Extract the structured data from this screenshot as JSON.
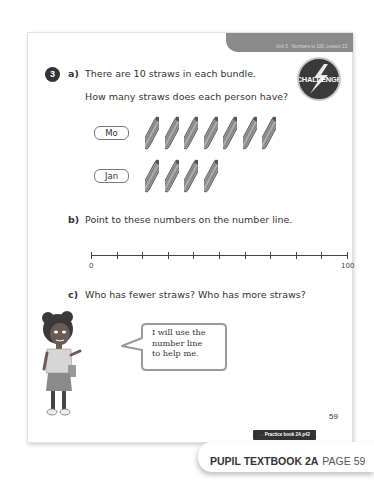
{
  "header": {
    "unit_label": "Unit 3 · Numbers to 100, Lesson 13",
    "badge_label": "CHALLENGE"
  },
  "question": {
    "number": "3",
    "part_a": {
      "label": "a)",
      "line1": "There are 10 straws in each bundle.",
      "line2": "How many straws does each person have?",
      "rows": [
        {
          "name": "Mo",
          "bundles": 7
        },
        {
          "name": "Jan",
          "bundles": 4
        }
      ]
    },
    "part_b": {
      "label": "b)",
      "text": "Point to these numbers on the number line.",
      "number_line": {
        "start_label": "0",
        "end_label": "100",
        "ticks": 11
      }
    },
    "part_c": {
      "label": "c)",
      "text": "Who has fewer straws? Who has more straws?",
      "speech_bubble": "I will use the\nnumber line\nto help me."
    }
  },
  "footer": {
    "page_number": "59",
    "practice_link": "→ Practice book 2A p42",
    "book_title": "PUPIL TEXTBOOK 2A",
    "page_label": "PAGE 59"
  },
  "colors": {
    "tab_grey": "#8a8a8a",
    "badge_dark": "#3a3a3a",
    "text": "#333333"
  }
}
